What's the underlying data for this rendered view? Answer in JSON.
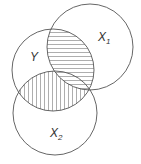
{
  "diagram": {
    "type": "venn",
    "sets": [
      {
        "id": "X1",
        "label": "X",
        "subscript": "1"
      },
      {
        "id": "Y",
        "label": "Y",
        "subscript": ""
      },
      {
        "id": "X2",
        "label": "X",
        "subscript": "2"
      }
    ],
    "shaded_regions": [
      {
        "region": "Y ∩ X1",
        "pattern": "horizontal-lines"
      },
      {
        "region": "Y ∩ X2",
        "pattern": "vertical-lines"
      }
    ],
    "colors": {
      "stroke": "#555555",
      "hatch": "#666666",
      "background": "#ffffff"
    }
  }
}
